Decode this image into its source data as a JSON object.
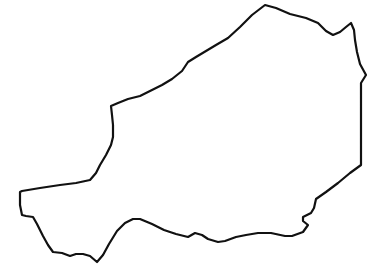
{
  "map": {
    "subject": "Niger country outline",
    "stroke_color": "#111111",
    "background_color": "#ffffff",
    "stroke_width": 2.2,
    "outline_path": "M111,106 L118,103 L128,99 L140,96 L150,91 L162,85 L172,79 L182,71 L188,62 L196,57 L206,51 L216,45 L228,38 L240,27 L252,15 L265,5 L276,8 L290,14 L306,18 L318,23 L326,31 L333,35 L340,32 L346,27 L351,23 L354,30 L355,40 L357,52 L360,64 L366,75 L361,83 L361,100 L361,120 L361,137 L361,150 L361,165 L350,173 L338,183 L326,192 L316,199 L314,208 L311,213 L303,217 L303,221 L308,225 L303,232 L292,236 L285,236 L271,233 L258,233 L246,235 L236,237 L225,241 L218,242 L208,239 L202,235 L195,233 L188,237 L176,234 L164,230 L152,224 L140,219 L133,219 L125,223 L117,231 L109,244 L103,255 L97,262 L90,256 L83,254 L76,254 L70,256 L62,253 L53,252 L48,245 L43,236 L37,224 L33,217 L26,216 L22,215 L20,205 L20,192 L22,191 L40,188 L60,185 L76,183 L90,180 L96,173 L100,165 L106,155 L111,145 L113,137 L113,125 L112,115 L111,106 Z"
  }
}
